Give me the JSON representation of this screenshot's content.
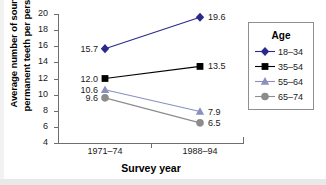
{
  "chart_data": {
    "type": "line",
    "title": "",
    "xlabel": "Survey year",
    "ylabel": "Average number of sound permanent teeth per person",
    "ylabel_line1": "Average number of sound",
    "ylabel_line2": "permanent teeth per person",
    "categories": [
      "1971–74",
      "1988–94"
    ],
    "ylim": [
      4,
      20
    ],
    "yticks": [
      20,
      18,
      16,
      14,
      12,
      10,
      8,
      6,
      4
    ],
    "grid": false,
    "legend_position": "right",
    "legend_title": "Age",
    "series": [
      {
        "name": "18–34",
        "values": [
          15.7,
          19.6
        ],
        "labels": [
          "15.7",
          "19.6"
        ],
        "color": "#2a2a8c",
        "marker": "diamond"
      },
      {
        "name": "35–54",
        "values": [
          12.0,
          13.5
        ],
        "labels": [
          "12.0",
          "13.5"
        ],
        "color": "#000000",
        "marker": "square"
      },
      {
        "name": "55–64",
        "values": [
          10.6,
          7.9
        ],
        "labels": [
          "10.6",
          "7.9"
        ],
        "color": "#8b8fc0",
        "marker": "triangle"
      },
      {
        "name": "65–74",
        "values": [
          9.6,
          6.5
        ],
        "labels": [
          "9.6",
          "6.5"
        ],
        "color": "#8c8c8c",
        "marker": "circle"
      }
    ]
  }
}
